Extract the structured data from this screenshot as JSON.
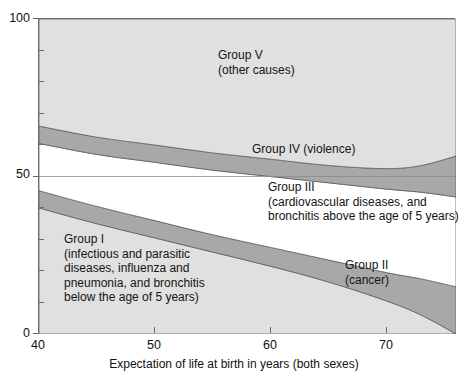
{
  "chart_data": {
    "type": "area",
    "title": "",
    "xlabel": "Expectation of life at birth in years (both sexes)",
    "ylabel": "",
    "xlim": [
      40,
      76
    ],
    "ylim": [
      0,
      100
    ],
    "grid": false,
    "stacked": true,
    "x_ticks": [
      40,
      50,
      60,
      70
    ],
    "x_tick_labels": [
      "40",
      "50",
      "60",
      "70"
    ],
    "y_ticks": [
      0,
      10,
      20,
      30,
      40,
      50,
      60,
      70,
      80,
      90,
      100
    ],
    "y_tick_labels": [
      "0",
      "",
      "",
      "",
      "",
      "50",
      "",
      "",
      "",
      "",
      "100"
    ],
    "y_labeled_ticks": [
      "0",
      "50",
      "100"
    ],
    "x": [
      40,
      45,
      50,
      55,
      60,
      65,
      70,
      73,
      76
    ],
    "series": [
      {
        "name": "Group I",
        "label": "Group I\n(infectious and parasitic\ndiseases, influenza and\npneumonia, and bronchitis\nbelow the age of 5 years)",
        "fill": "#e0e0e0",
        "values": [
          40,
          35,
          30.5,
          26,
          21.5,
          16.5,
          10.5,
          6,
          0
        ]
      },
      {
        "name": "Group II",
        "label": "Group II\n(cancer)",
        "fill": "#a8a8a8",
        "values": [
          5.5,
          5.5,
          5.5,
          5.5,
          6,
          7,
          9,
          11.5,
          15
        ]
      },
      {
        "name": "Group III",
        "label": "Group III\n(cardiovascular diseases, and\nbronchitis above the age of 5 years)",
        "fill": "#ffffff",
        "values": [
          15,
          16.5,
          18.5,
          20.5,
          22.5,
          24.5,
          26.5,
          27.5,
          28.5
        ]
      },
      {
        "name": "Group IV",
        "label": "Group IV (violence)",
        "fill": "#a8a8a8",
        "values": [
          5.5,
          5.5,
          5.5,
          5.5,
          5.5,
          5.5,
          6.5,
          8.5,
          13
        ]
      },
      {
        "name": "Group V",
        "label": "Group V\n(other causes)",
        "fill": "#e0e0e0",
        "values": [
          34,
          37.5,
          40,
          42.5,
          44.5,
          46.5,
          47.5,
          46.5,
          43.5
        ]
      }
    ],
    "annotations": [
      {
        "name": "group-v-label",
        "text": "Group V\n(other causes)",
        "x": 57.5,
        "y": 78
      },
      {
        "name": "group-iv-label",
        "text": "Group IV (violence)",
        "x": 62.5,
        "y": 54.5
      },
      {
        "name": "group-iii-label",
        "text": "Group III\n(cardiovascular diseases, and\nbronchitis above the age of 5 years)",
        "x": 61,
        "y": 44
      },
      {
        "name": "group-ii-label",
        "text": "Group II\n(cancer)",
        "x": 69,
        "y": 20.5
      },
      {
        "name": "group-i-label",
        "text": "Group I\n(infectious and parasitic\ndiseases, influenza and\npneumonia, and bronchitis\nbelow the age of 5 years)",
        "x": 48,
        "y": 17
      }
    ],
    "colors": {
      "light_band": "#e0e0e0",
      "dark_band": "#a8a8a8",
      "white_band": "#ffffff",
      "frame": "#6b6b6b",
      "text": "#141414"
    }
  },
  "axes": {
    "y_labels": [
      {
        "text": "100",
        "value": 100
      },
      {
        "text": "50",
        "value": 50
      },
      {
        "text": "0",
        "value": 0
      }
    ],
    "x_labels": [
      {
        "text": "40",
        "value": 40
      },
      {
        "text": "50",
        "value": 50
      },
      {
        "text": "60",
        "value": 60
      },
      {
        "text": "70",
        "value": 70
      }
    ],
    "x_title": "Expectation of life at birth in years (both sexes)"
  },
  "bands": {
    "group_v_line1": "Group V",
    "group_v_line2": "(other causes)",
    "group_iv": "Group IV (violence)",
    "group_iii_line1": "Group III",
    "group_iii_line2": "(cardiovascular diseases, and",
    "group_iii_line3": "bronchitis above the age of 5 years)",
    "group_ii_line1": "Group II",
    "group_ii_line2": "(cancer)",
    "group_i_line1": "Group I",
    "group_i_line2": "(infectious and parasitic",
    "group_i_line3": "diseases, influenza and",
    "group_i_line4": "pneumonia, and bronchitis",
    "group_i_line5": "below the age of 5 years)"
  }
}
